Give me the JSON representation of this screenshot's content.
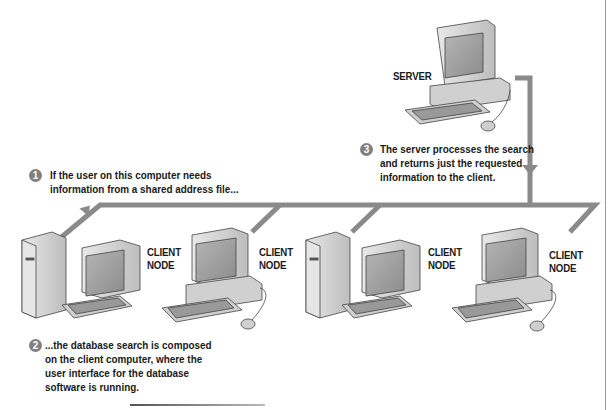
{
  "diagram": {
    "colors": {
      "network_line": "#8a8a8a",
      "badge": "#808080",
      "text": "#1a1a1a",
      "computer_body": "#d9d9d9",
      "screen": "#9a9a9a"
    },
    "server": {
      "label": "SERVER"
    },
    "client_nodes": [
      {
        "label_line1": "CLIENT",
        "label_line2": "NODE",
        "type": "tower-with-monitor"
      },
      {
        "label_line1": "CLIENT",
        "label_line2": "NODE",
        "type": "desktop-with-mouse"
      },
      {
        "label_line1": "CLIENT",
        "label_line2": "NODE",
        "type": "tower-with-monitor"
      },
      {
        "label_line1": "CLIENT",
        "label_line2": "NODE",
        "type": "desktop-with-mouse"
      }
    ],
    "steps": [
      {
        "number": "1",
        "lines": [
          "If the user on this computer needs",
          "information from a shared address file..."
        ]
      },
      {
        "number": "2",
        "lines": [
          "...the database search is composed",
          "on the client computer, where the",
          "user interface for the database",
          "software is running."
        ]
      },
      {
        "number": "3",
        "lines": [
          "The server processes the search",
          "and returns just the requested",
          "information to the client."
        ]
      }
    ]
  }
}
